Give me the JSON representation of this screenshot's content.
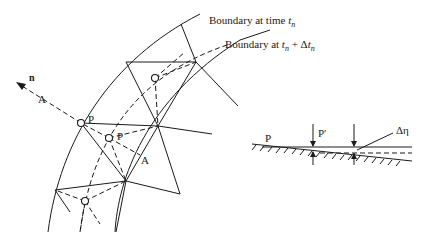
{
  "labels": {
    "boundary_tn": "Boundary at time ",
    "boundary_tn_var": "t",
    "boundary_tn_sub": "n",
    "boundary_next": "Boundary at ",
    "boundary_next_t": "t",
    "boundary_next_sub": "n",
    "boundary_next_plus": " + Δ",
    "boundary_next_t2": "t",
    "boundary_next_sub2": "n",
    "normal": "n",
    "point_a_outer": "A",
    "point_a_inner": "A",
    "point_p": "P",
    "point_p_moved": "P",
    "detail_p": "P",
    "detail_p_prime": "P′",
    "delta_eta": "Δη"
  },
  "colors": {
    "ink": "#1a1a1a",
    "background": "#ffffff"
  }
}
